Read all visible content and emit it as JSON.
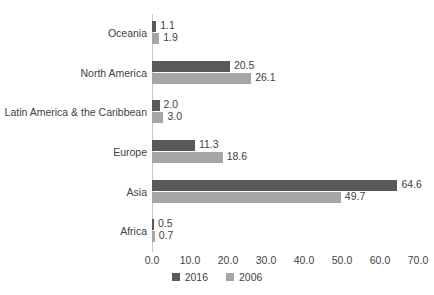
{
  "chart_data": {
    "type": "bar",
    "orientation": "horizontal",
    "title": "",
    "subtitle": "",
    "xlabel": "",
    "ylabel": "",
    "categories": [
      "Oceania",
      "North America",
      "Latin America & the Caribbean",
      "Europe",
      "Asia",
      "Africa"
    ],
    "series": [
      {
        "name": "2016",
        "color": "#595959",
        "values": [
          1.1,
          20.5,
          2.0,
          11.3,
          64.6,
          0.5
        ]
      },
      {
        "name": "2006",
        "color": "#a6a6a6",
        "values": [
          1.9,
          26.1,
          3.0,
          18.6,
          49.7,
          0.7
        ]
      }
    ],
    "data_labels": [
      {
        "category": "Oceania",
        "v2016": "1.1",
        "v2006": "1.9"
      },
      {
        "category": "North America",
        "v2016": "20.5",
        "v2006": "26.1"
      },
      {
        "category": "Latin America & the Caribbean",
        "v2016": "2.0",
        "v2006": "3.0"
      },
      {
        "category": "Europe",
        "v2016": "11.3",
        "v2006": "18.6"
      },
      {
        "category": "Asia",
        "v2016": "64.6",
        "v2006": "49.7"
      },
      {
        "category": "Africa",
        "v2016": "0.5",
        "v2006": "0.7"
      }
    ],
    "xlim": [
      0.0,
      70.0
    ],
    "xticks": [
      "0.0",
      "10.0",
      "20.0",
      "30.0",
      "40.0",
      "50.0",
      "60.0",
      "70.0"
    ],
    "xtick_values": [
      0,
      10,
      20,
      30,
      40,
      50,
      60,
      70
    ],
    "grid": false,
    "legend": {
      "position": "bottom",
      "entries": [
        "2016",
        "2006"
      ]
    }
  },
  "colors": {
    "series_2016": "#595959",
    "series_2006": "#a6a6a6",
    "axis_line": "#c9c9c9",
    "text": "#3f3f3f",
    "background": "#ffffff"
  }
}
